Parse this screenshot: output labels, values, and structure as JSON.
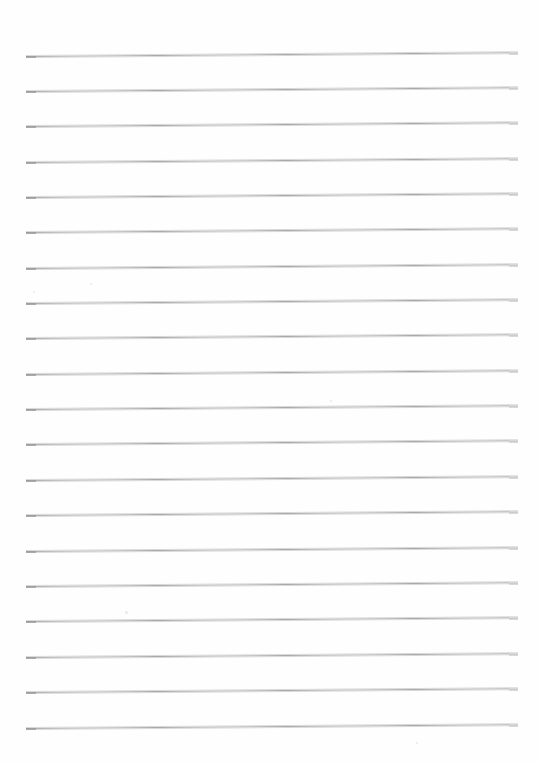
{
  "document": {
    "kind": "lined-paper-scan",
    "title": "Blank ruled notebook page",
    "page_width": 538,
    "page_height": 764,
    "background_color": "#ffffff",
    "paper_tone": "#fefefe",
    "content_text": "",
    "is_blank": true
  },
  "ruling": {
    "line_color": "#a9a9a9",
    "line_halo_color": "#d8d8d8",
    "line_thickness": 1,
    "line_count": 20,
    "first_line_y": 56,
    "line_spacing": 35.4,
    "left_x": 26,
    "right_x": 518,
    "skew_degrees": -0.45,
    "lines": [
      {
        "index": 1,
        "y": 56
      },
      {
        "index": 2,
        "y": 91
      },
      {
        "index": 3,
        "y": 126
      },
      {
        "index": 4,
        "y": 162
      },
      {
        "index": 5,
        "y": 197
      },
      {
        "index": 6,
        "y": 232
      },
      {
        "index": 7,
        "y": 268
      },
      {
        "index": 8,
        "y": 303
      },
      {
        "index": 9,
        "y": 338
      },
      {
        "index": 10,
        "y": 374
      },
      {
        "index": 11,
        "y": 409
      },
      {
        "index": 12,
        "y": 444
      },
      {
        "index": 13,
        "y": 480
      },
      {
        "index": 14,
        "y": 515
      },
      {
        "index": 15,
        "y": 551
      },
      {
        "index": 16,
        "y": 586
      },
      {
        "index": 17,
        "y": 621
      },
      {
        "index": 18,
        "y": 657
      },
      {
        "index": 19,
        "y": 692
      },
      {
        "index": 20,
        "y": 728
      }
    ]
  },
  "artifacts": {
    "specks": [
      {
        "x": 125,
        "y": 611,
        "size": 3
      },
      {
        "x": 330,
        "y": 400,
        "size": 2
      },
      {
        "x": 33,
        "y": 291,
        "size": 2
      },
      {
        "x": 416,
        "y": 742,
        "size": 2
      },
      {
        "x": 90,
        "y": 283,
        "size": 2
      }
    ]
  }
}
